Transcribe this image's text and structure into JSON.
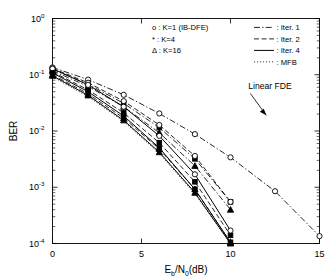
{
  "chart_data": {
    "type": "line",
    "title": "",
    "xlabel": "E_b/N_0(dB)",
    "xlabel_parts": {
      "pre": "E",
      "sub1": "b",
      "mid": "/N",
      "sub2": "0",
      "post": "(dB)"
    },
    "ylabel": "BER",
    "xlim": [
      0,
      15
    ],
    "ylim": [
      0.0001,
      1
    ],
    "yscale": "log",
    "xticks": [
      0,
      5,
      10,
      15
    ],
    "xticklabels": [
      "0",
      "5",
      "10",
      "15"
    ],
    "yticks": [
      1,
      0.1,
      0.01,
      0.001,
      0.0001
    ],
    "yticklabels": [
      "10^0",
      "10^-1",
      "10^-2",
      "10^-3",
      "10^-4"
    ],
    "ytick_mantissa": [
      "10",
      "10",
      "10",
      "10",
      "10"
    ],
    "ytick_exponent": [
      "0",
      "-1",
      "-2",
      "-3",
      "-4"
    ],
    "grid": false,
    "legend_position": "top-center-right",
    "annotations": [
      {
        "text": "Linear FDE",
        "x": 11.0,
        "y": 0.055
      }
    ],
    "marker_legend": [
      {
        "symbol": "o",
        "label": "o : K=1 (IB-DFE)",
        "marker": "circle"
      },
      {
        "symbol": "*",
        "label": "* : K=4",
        "marker": "star"
      },
      {
        "symbol": "Δ",
        "label": "Δ : K=16",
        "marker": "triangle"
      }
    ],
    "line_legend": [
      {
        "label": ": Iter. 1",
        "style": "dashdot"
      },
      {
        "label": ": Iter. 2",
        "style": "dashed"
      },
      {
        "label": ": Iter. 4",
        "style": "solid"
      },
      {
        "label": ": MFB",
        "style": "dotted"
      }
    ],
    "series": [
      {
        "name": "K=1 (IB-DFE), Iter. 1 / Linear FDE",
        "marker": "circle",
        "style": "dashdot",
        "x": [
          0,
          2,
          4,
          6,
          8,
          10,
          12.5,
          15
        ],
        "values": [
          0.135,
          0.082,
          0.044,
          0.0205,
          0.0088,
          0.0034,
          0.00085,
          0.000135
        ]
      },
      {
        "name": "K=4, Iter. 1",
        "marker": "star",
        "style": "dashdot",
        "x": [
          0,
          2,
          4,
          6,
          8,
          10
        ],
        "values": [
          0.125,
          0.068,
          0.031,
          0.0115,
          0.0032,
          0.00055
        ]
      },
      {
        "name": "K=16, Iter. 1",
        "marker": "triangle",
        "style": "dashdot",
        "x": [
          0,
          2,
          4,
          6,
          8,
          10
        ],
        "values": [
          0.118,
          0.062,
          0.027,
          0.0093,
          0.0024,
          0.0004
        ]
      },
      {
        "name": "K=1 (IB-DFE), Iter. 2",
        "marker": "circle",
        "style": "dashed",
        "x": [
          0,
          2,
          4,
          6,
          8,
          10
        ],
        "values": [
          0.13,
          0.072,
          0.034,
          0.0128,
          0.0036,
          0.00055
        ]
      },
      {
        "name": "K=4, Iter. 2",
        "marker": "star",
        "style": "dashed",
        "x": [
          0,
          2,
          4,
          6,
          8,
          10
        ],
        "values": [
          0.112,
          0.054,
          0.021,
          0.0062,
          0.00125,
          0.00014
        ]
      },
      {
        "name": "K=16, Iter. 2",
        "marker": "triangle",
        "style": "dashed",
        "x": [
          0,
          2,
          4,
          6,
          8,
          10
        ],
        "values": [
          0.1,
          0.046,
          0.017,
          0.0048,
          0.00092,
          0.000105
        ]
      },
      {
        "name": "K=1 (IB-DFE), Iter. 4",
        "marker": "circle",
        "style": "solid",
        "x": [
          0,
          2,
          4,
          6,
          8,
          10
        ],
        "values": [
          0.128,
          0.066,
          0.027,
          0.0082,
          0.0017,
          0.00017
        ]
      },
      {
        "name": "K=4, Iter. 4",
        "marker": "star",
        "style": "solid",
        "x": [
          0,
          2,
          4,
          6,
          8,
          10
        ],
        "values": [
          0.108,
          0.05,
          0.0185,
          0.005,
          0.00092,
          0.000105
        ]
      },
      {
        "name": "K=16, Iter. 4",
        "marker": "triangle",
        "style": "solid",
        "x": [
          0,
          2,
          4,
          6,
          8,
          10
        ],
        "values": [
          0.096,
          0.043,
          0.0155,
          0.0042,
          0.0008,
          0.0001
        ]
      },
      {
        "name": "MFB",
        "marker": "none",
        "style": "dotted",
        "x": [
          0,
          2,
          4,
          6,
          8,
          10
        ],
        "values": [
          0.092,
          0.041,
          0.0148,
          0.004,
          0.00076,
          0.0001
        ]
      }
    ]
  }
}
